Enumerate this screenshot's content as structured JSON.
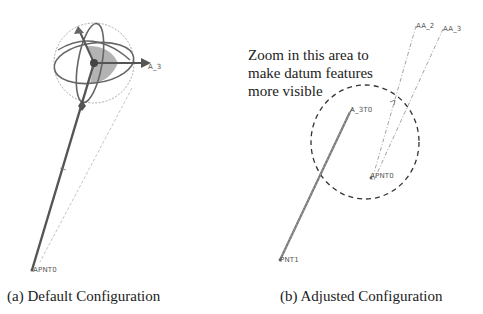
{
  "figure": {
    "panels": [
      {
        "id": "a",
        "caption": "(a) Default Configuration",
        "labels": {
          "arrow_label": "A_3",
          "point_label": "APNT0"
        }
      },
      {
        "id": "b",
        "caption": "(b) Adjusted Configuration",
        "annotation": [
          "Zoom in this area to",
          "make datum features",
          "more visible"
        ],
        "labels": {
          "axis_1": "AA_2",
          "axis_2": "AA_3",
          "axis_start": "A_3T0",
          "point_1": "APNT0",
          "point_2": "PNT1"
        }
      }
    ],
    "colors": {
      "line_dark": "#555555",
      "line_light": "#aaaaaa",
      "shade": "#9a9a9a",
      "text": "#222222"
    }
  }
}
